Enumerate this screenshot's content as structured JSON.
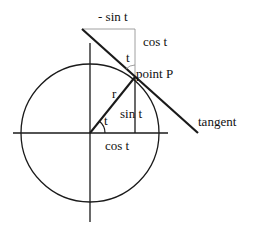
{
  "diagram": {
    "colors": {
      "stroke": "#1a1a1a",
      "thin": "#888888",
      "background": "#ffffff"
    },
    "labels": {
      "neg_sin_t": "- sin t",
      "cos_t_top": "cos t",
      "angle_t_top": "t",
      "point_p": "point P",
      "radius_r": "r",
      "angle_t_center": "t",
      "sin_t": "sin t",
      "cos_t_bottom": "cos t",
      "tangent": "tangent"
    }
  }
}
